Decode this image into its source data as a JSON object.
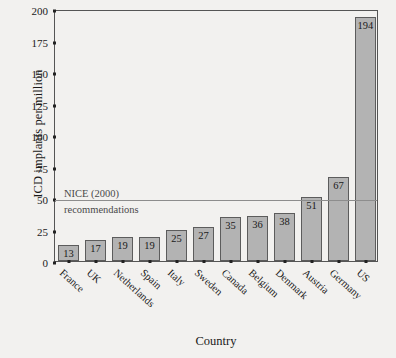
{
  "chart_data": {
    "type": "bar",
    "title": "",
    "xlabel": "Country",
    "ylabel": "ICD implants per million",
    "categories": [
      "France",
      "UK",
      "Netherlands",
      "Spain",
      "Italy",
      "Sweden",
      "Canada",
      "Belgium",
      "Denmark",
      "Austria",
      "Germany",
      "US"
    ],
    "values": [
      13,
      17,
      19,
      19,
      25,
      27,
      35,
      36,
      38,
      51,
      67,
      194
    ],
    "ylim": [
      0,
      200
    ],
    "yticks": [
      0,
      25,
      50,
      75,
      100,
      125,
      150,
      175,
      200
    ],
    "ytick_labels": [
      "0",
      "25",
      "50",
      "75",
      "100",
      "125",
      "150",
      "175",
      "200"
    ],
    "grid": false,
    "legend": "none",
    "annotations": [
      {
        "name": "nice-recommendation-line",
        "value": 50,
        "text_line1": "NICE (2000)",
        "text_line2": "recommendations"
      }
    ],
    "colors": {
      "bar_fill": "#b3b3b3",
      "bar_edge": "#5c5c5c",
      "axis": "#555555",
      "annotation_line": "#8d8d8d",
      "background": "#f2f1ef",
      "text": "#1a1a1a"
    }
  }
}
